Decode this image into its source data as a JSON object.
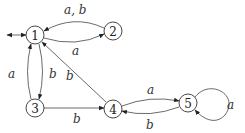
{
  "diagram": {
    "type": "finite-automaton",
    "nodes": [
      {
        "id": "1",
        "label": "1",
        "x": 35,
        "y": 35,
        "initial": true
      },
      {
        "id": "2",
        "label": "2",
        "x": 113,
        "y": 31
      },
      {
        "id": "3",
        "label": "3",
        "x": 35,
        "y": 108
      },
      {
        "id": "4",
        "label": "4",
        "x": 113,
        "y": 109
      },
      {
        "id": "5",
        "label": "5",
        "x": 188,
        "y": 103
      }
    ],
    "edges": [
      {
        "from": "2",
        "to": "1",
        "label": "a, b"
      },
      {
        "from": "1",
        "to": "2",
        "label": "a"
      },
      {
        "from": "3",
        "to": "1",
        "label": "a"
      },
      {
        "from": "1",
        "to": "3",
        "label": "b"
      },
      {
        "from": "4",
        "to": "1",
        "label": "b"
      },
      {
        "from": "3",
        "to": "4",
        "label": "b"
      },
      {
        "from": "4",
        "to": "5",
        "label": "a"
      },
      {
        "from": "5",
        "to": "4",
        "label": "b"
      },
      {
        "from": "5",
        "to": "5",
        "label": "a"
      }
    ]
  }
}
